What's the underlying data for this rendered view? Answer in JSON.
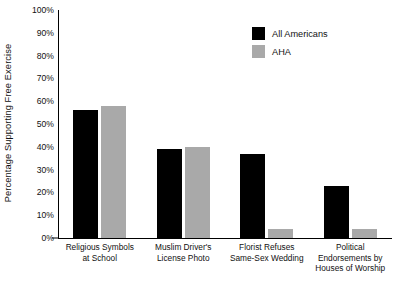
{
  "chart_data": {
    "type": "bar",
    "title": "",
    "xlabel": "",
    "ylabel": "Percentage Supporting Free Exercise",
    "ylim": [
      0,
      100
    ],
    "grid": false,
    "legend_position": "top-right-inside",
    "categories": [
      "Religious Symbols\nat School",
      "Muslim Driver's\nLicense Photo",
      "Florist Refuses\nSame-Sex Wedding",
      "Political\nEndorsements by\nHouses of Worship"
    ],
    "category_lines": [
      [
        "Religious Symbols",
        "at School"
      ],
      [
        "Muslim Driver's",
        "License Photo"
      ],
      [
        "Florist Refuses",
        "Same-Sex Wedding"
      ],
      [
        "Political",
        "Endorsements by",
        "Houses of Worship"
      ]
    ],
    "series": [
      {
        "name": "All Americans",
        "color": "#000000",
        "values": [
          56,
          39,
          37,
          23
        ]
      },
      {
        "name": "AHA",
        "color": "#a9a9a9",
        "values": [
          58,
          40,
          4,
          4
        ]
      }
    ],
    "ytick_labels": [
      "0%",
      "10%",
      "20%",
      "30%",
      "40%",
      "50%",
      "60%",
      "70%",
      "80%",
      "90%",
      "100%"
    ],
    "ytick_values": [
      0,
      10,
      20,
      30,
      40,
      50,
      60,
      70,
      80,
      90,
      100
    ]
  }
}
